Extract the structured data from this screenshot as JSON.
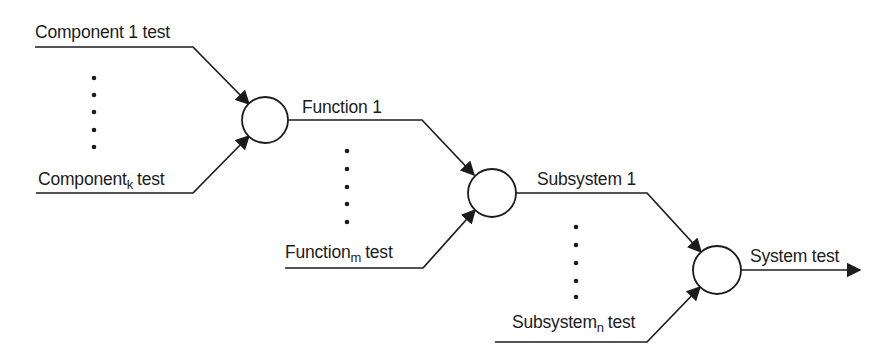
{
  "diagram": {
    "ink_color": "#1c1c1c",
    "background_color": "#ffffff",
    "labels": {
      "component_1": "Component 1 test",
      "component_k": {
        "base": "Component",
        "sub": "k",
        "rest": "test"
      },
      "function_1": "Function 1",
      "function_m": {
        "base": "Function",
        "sub": "m",
        "rest": "test"
      },
      "subsystem_1": "Subsystem 1",
      "subsystem_n": {
        "base": "Subsystem",
        "sub": "n",
        "rest": "test"
      },
      "system_test": "System test"
    },
    "ellipsis": {
      "columns": 3,
      "dots_per_column": 5
    }
  }
}
